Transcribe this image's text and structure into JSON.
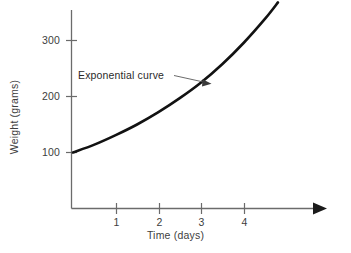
{
  "chart_data": {
    "type": "line",
    "title": "",
    "xlabel": "Time (days)",
    "ylabel": "Weight (grams)",
    "xlim": [
      0,
      4.8
    ],
    "ylim": [
      0,
      345
    ],
    "grid": false,
    "legend": "none",
    "x_ticks": [
      "1",
      "2",
      "3",
      "4"
    ],
    "x_tick_values": [
      1,
      2,
      3,
      4
    ],
    "y_ticks": [
      "100",
      "200",
      "300"
    ],
    "y_tick_values": [
      100,
      200,
      300
    ],
    "series": [
      {
        "name": "Exponential curve",
        "x": [
          0.0,
          0.5,
          1.0,
          1.5,
          2.0,
          2.5,
          3.0,
          3.5,
          4.0,
          4.5,
          4.8
        ],
        "y": [
          100,
          114,
          131,
          150,
          172,
          197,
          225,
          258,
          296,
          339,
          368
        ]
      }
    ],
    "annotations": [
      {
        "text": "Exponential curve",
        "points_to_x": 3.25,
        "points_to_y": 238
      }
    ],
    "axis_color": "#6b6b6b",
    "curve_color": "#121212",
    "text_color": "#3d3d3d"
  },
  "chart": {
    "annotation_text": "Exponential curve",
    "y_axis_title": "Weight (grams)",
    "x_axis_title": "Time (days)",
    "y_tick_300": "300",
    "y_tick_200": "200",
    "y_tick_100": "100",
    "x_tick_1": "1",
    "x_tick_2": "2",
    "x_tick_3": "3",
    "x_tick_4": "4"
  }
}
